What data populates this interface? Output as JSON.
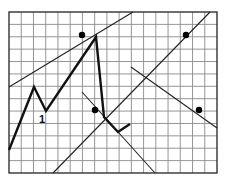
{
  "grid": {
    "x0": 9,
    "y0": 12,
    "x1": 217,
    "y1": 173,
    "cols": 17,
    "rows": 13,
    "line_color": "#8a8a8a",
    "border_color": "#333333"
  },
  "colors": {
    "thin_line": "#222222",
    "thick_line": "#111111",
    "dot": "#000000"
  },
  "thin_lines": [
    {
      "name": "diagonal-line-a",
      "points": "9,87 133,12"
    },
    {
      "name": "diagonal-line-b",
      "points": "53,173 210,12"
    },
    {
      "name": "diagonal-line-c",
      "points": "131,67 217,128"
    },
    {
      "name": "diagonal-line-d",
      "points": "82,92 155,173"
    }
  ],
  "thick_path": {
    "name": "zigzag-path",
    "points": "9,150 34,87 46,111 96,37 104,117 118,132 130,124"
  },
  "dots": [
    {
      "name": "dot-1",
      "cx": 82,
      "cy": 35
    },
    {
      "name": "dot-2",
      "cx": 186,
      "cy": 35
    },
    {
      "name": "dot-3",
      "cx": 95,
      "cy": 110
    },
    {
      "name": "dot-4",
      "cx": 199,
      "cy": 110
    }
  ],
  "labels": [
    {
      "name": "point-label-1",
      "text": "1",
      "x": 39,
      "y": 123
    }
  ]
}
